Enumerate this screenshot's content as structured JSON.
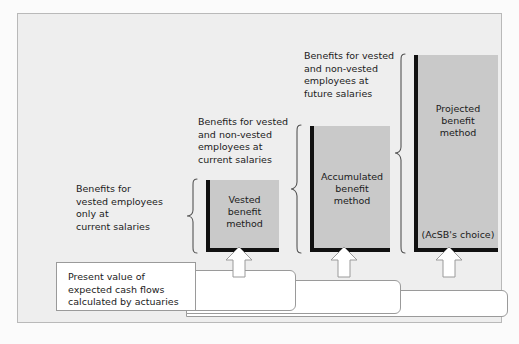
{
  "figure": {
    "background_color": "#eeeeee",
    "bar_fill_color": "#c9c9c9",
    "bar_edge_color": "#111111",
    "connector_color": "#ffffff"
  },
  "annotations": [
    {
      "id": "vested-only",
      "text": "Benefits for\nvested employees\nonly at\ncurrent salaries"
    },
    {
      "id": "vested-and-nonvested-current",
      "text": "Benefits for vested\nand non-vested\nemployees at\ncurrent salaries"
    },
    {
      "id": "vested-and-nonvested-future",
      "text": "Benefits for vested\nand non-vested\nemployees at\nfuture salaries"
    }
  ],
  "bars": [
    {
      "id": "vested-benefit-method",
      "label": "Vested\nbenefit\nmethod",
      "sublabel": ""
    },
    {
      "id": "accumulated-benefit-method",
      "label": "Accumulated\nbenefit\nmethod",
      "sublabel": ""
    },
    {
      "id": "projected-benefit-method",
      "label": "Projected\nbenefit\nmethod",
      "sublabel": "(AcSB's choice)"
    }
  ],
  "source": {
    "text": "Present value of\nexpected cash flows\ncalculated by actuaries"
  }
}
